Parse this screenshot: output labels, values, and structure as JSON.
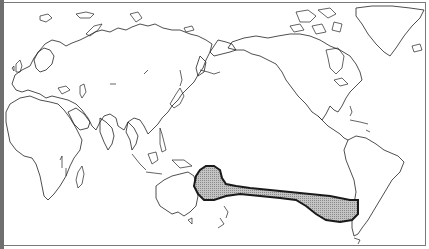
{
  "map": {
    "projection": "Pacific-centered world outline map",
    "regions": [
      {
        "name": "shaded-region",
        "description": "Hatched band extending from eastern Australia / Coral Sea across the South Pacific to the coast of Chile",
        "fill": "#b8b8b8",
        "stroke": "#1a1a1a"
      }
    ],
    "colors": {
      "background": "#ffffff",
      "coastline": "#222222",
      "border_left": "#6f6f6f",
      "border": "#7a7a7a",
      "region_fill": "#b8b8b8"
    }
  }
}
